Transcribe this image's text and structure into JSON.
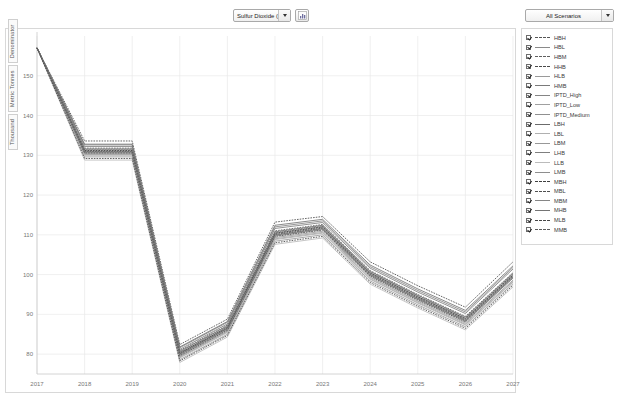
{
  "toolbar": {
    "pollutant_select": {
      "value": "Sulfur Dioxide (SO2)",
      "icon": "chevron-down-icon"
    },
    "scenario_select": {
      "value": "All Scenarios",
      "icon": "chevron-down-icon"
    },
    "chart_type_button": {
      "icon": "chart-icon",
      "label": ""
    }
  },
  "chart_data": {
    "type": "line",
    "title": "",
    "xlabel": "",
    "ylabel": "Thousand  Metric Tonnes  Denominator",
    "ylabel_parts": [
      "Thousand",
      "Metric Tonnes",
      "Denominator"
    ],
    "x": [
      2017,
      2018,
      2019,
      2020,
      2021,
      2022,
      2023,
      2024,
      2025,
      2026,
      2027
    ],
    "xtick_labels": [
      "2017",
      "2018",
      "2019",
      "2020",
      "2021",
      "2022",
      "2023",
      "2024",
      "2025",
      "2026",
      "2027"
    ],
    "ytick_labels": [
      "150",
      "140",
      "130",
      "120",
      "110",
      "100",
      "90",
      "80"
    ],
    "yticks": [
      150,
      140,
      130,
      120,
      110,
      100,
      90,
      80
    ],
    "ylim": [
      75,
      160
    ],
    "xlim": [
      2017,
      2027
    ],
    "grid": true,
    "legend_position": "right",
    "series": [
      {
        "name": "HBH",
        "dash": "dashed",
        "color": "#555555",
        "values": [
          157.0,
          131.8,
          131.8,
          80.9,
          87.3,
          111.0,
          112.6,
          101.0,
          95.0,
          89.5,
          100.5
        ]
      },
      {
        "name": "HBL",
        "dash": "solid",
        "color": "#8a8a8a",
        "values": [
          157.0,
          131.1,
          131.1,
          80.2,
          86.6,
          110.3,
          111.9,
          100.3,
          94.3,
          88.8,
          99.8
        ]
      },
      {
        "name": "HBM",
        "dash": "dashed",
        "color": "#606060",
        "values": [
          157.0,
          131.5,
          131.5,
          80.6,
          87.0,
          110.7,
          112.3,
          100.7,
          94.7,
          89.2,
          100.2
        ]
      },
      {
        "name": "HHB",
        "dash": "dashed",
        "color": "#4a4a4a",
        "values": [
          157.0,
          133.6,
          133.6,
          82.4,
          88.8,
          113.2,
          114.6,
          103.2,
          97.2,
          91.8,
          103.2
        ]
      },
      {
        "name": "HLB",
        "dash": "solid",
        "color": "#9a9a9a",
        "values": [
          157.0,
          129.6,
          129.6,
          78.6,
          85.0,
          108.4,
          110.0,
          98.4,
          92.4,
          86.9,
          97.7
        ]
      },
      {
        "name": "HMB",
        "dash": "solid",
        "color": "#7a7a7a",
        "values": [
          157.0,
          131.6,
          131.6,
          80.7,
          87.1,
          110.8,
          112.4,
          100.8,
          94.8,
          89.3,
          100.3
        ]
      },
      {
        "name": "IPTD_High",
        "dash": "solid",
        "color": "#858585",
        "values": [
          157.0,
          132.6,
          132.6,
          81.6,
          88.0,
          112.0,
          113.5,
          102.0,
          96.0,
          90.6,
          101.8
        ]
      },
      {
        "name": "IPTD_Low",
        "dash": "solid",
        "color": "#a0a0a0",
        "values": [
          157.0,
          130.2,
          130.2,
          79.2,
          85.6,
          109.0,
          110.6,
          99.0,
          93.0,
          87.5,
          98.3
        ]
      },
      {
        "name": "IPTD_Medium",
        "dash": "solid",
        "color": "#909090",
        "values": [
          157.0,
          131.4,
          131.4,
          80.4,
          86.8,
          110.5,
          112.1,
          100.5,
          94.5,
          89.0,
          100.0
        ]
      },
      {
        "name": "LBH",
        "dash": "solid",
        "color": "#6b6b6b",
        "values": [
          157.0,
          130.8,
          130.8,
          79.9,
          86.3,
          109.9,
          111.5,
          99.9,
          93.9,
          88.4,
          99.4
        ]
      },
      {
        "name": "LBL",
        "dash": "solid",
        "color": "#b0b0b0",
        "values": [
          157.0,
          130.0,
          130.0,
          79.0,
          85.4,
          108.8,
          110.4,
          98.8,
          92.8,
          87.3,
          98.1
        ]
      },
      {
        "name": "LBM",
        "dash": "solid",
        "color": "#989898",
        "values": [
          157.0,
          130.4,
          130.4,
          79.4,
          85.8,
          109.3,
          110.9,
          99.3,
          93.3,
          87.8,
          98.6
        ]
      },
      {
        "name": "LHB",
        "dash": "solid",
        "color": "#7f7f7f",
        "values": [
          157.0,
          132.2,
          132.2,
          81.2,
          87.6,
          111.6,
          113.1,
          101.6,
          95.6,
          90.2,
          101.4
        ]
      },
      {
        "name": "LLB",
        "dash": "solid",
        "color": "#bbbbbb",
        "values": [
          157.0,
          128.8,
          128.8,
          77.9,
          84.3,
          107.6,
          109.2,
          97.6,
          91.6,
          86.1,
          96.9
        ]
      },
      {
        "name": "LMB",
        "dash": "solid",
        "color": "#8e8e8e",
        "values": [
          157.0,
          130.6,
          130.6,
          79.7,
          86.1,
          109.7,
          111.3,
          99.7,
          93.7,
          88.2,
          99.2
        ]
      },
      {
        "name": "MBH",
        "dash": "dashed",
        "color": "#3f3f3f",
        "values": [
          157.0,
          131.2,
          131.2,
          80.3,
          86.7,
          110.4,
          112.0,
          100.4,
          94.4,
          88.9,
          99.9
        ]
      },
      {
        "name": "MBL",
        "dash": "dashed",
        "color": "#4f4f4f",
        "values": [
          157.0,
          130.6,
          130.6,
          79.6,
          86.0,
          109.6,
          111.2,
          99.6,
          93.6,
          88.1,
          99.1
        ]
      },
      {
        "name": "MBM",
        "dash": "solid",
        "color": "#868686",
        "values": [
          157.0,
          130.9,
          130.9,
          80.0,
          86.4,
          110.0,
          111.6,
          100.0,
          94.0,
          88.5,
          99.5
        ]
      },
      {
        "name": "MHB",
        "dash": "solid",
        "color": "#747474",
        "values": [
          157.0,
          132.8,
          132.8,
          81.8,
          88.2,
          112.4,
          113.9,
          102.4,
          96.4,
          91.0,
          102.2
        ]
      },
      {
        "name": "MLB",
        "dash": "dashed",
        "color": "#454545",
        "values": [
          157.0,
          129.2,
          129.2,
          78.3,
          84.7,
          108.0,
          109.6,
          98.0,
          92.0,
          86.5,
          97.3
        ]
      },
      {
        "name": "MMB",
        "dash": "dashed",
        "color": "#5a5a5a",
        "values": [
          157.0,
          131.0,
          131.0,
          80.1,
          86.5,
          110.1,
          111.7,
          100.1,
          94.1,
          88.6,
          99.6
        ]
      }
    ]
  }
}
